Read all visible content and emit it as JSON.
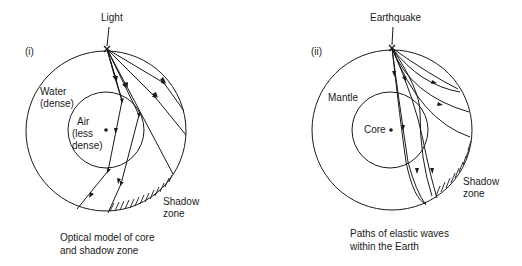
{
  "panel_i": {
    "label": "(i)",
    "source_label": "Light",
    "outer_label_line1": "Water",
    "outer_label_line2": "(dense)",
    "inner_label_line1": "Air",
    "inner_label_line2": "(less",
    "inner_label_line3": "dense)",
    "shadow_line1": "Shadow",
    "shadow_line2": "zone",
    "caption_line1": "Optical model of core",
    "caption_line2": "and shadow zone"
  },
  "panel_ii": {
    "label": "(ii)",
    "source_label": "Earthquake",
    "outer_label": "Mantle",
    "inner_label": "Core",
    "shadow_line1": "Shadow",
    "shadow_line2": "zone",
    "caption_line1": "Paths of elastic waves",
    "caption_line2": "within the Earth"
  },
  "colors": {
    "ink": "#1a1a1a",
    "background": "#ffffff"
  }
}
